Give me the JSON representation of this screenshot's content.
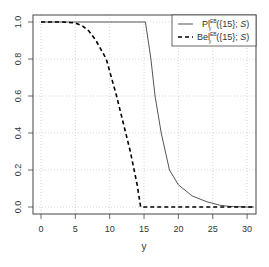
{
  "chart_data": {
    "type": "line",
    "title": "",
    "xlabel": "y",
    "ylabel": "",
    "xlim": [
      -1.2,
      31.2
    ],
    "ylim": [
      -0.04,
      1.04
    ],
    "grid": true,
    "legend_position": "top-right",
    "x_ticks": [
      "0",
      "5",
      "10",
      "15",
      "20",
      "25",
      "30"
    ],
    "y_ticks": [
      "0.0",
      "0.2",
      "0.4",
      "0.6",
      "0.8",
      "1.0"
    ],
    "series": [
      {
        "name": "Pl_y^EB({15}; S)",
        "style": "solid",
        "color": "#555555",
        "x": [
          0,
          5,
          10,
          15,
          15.2,
          16,
          16.6,
          17.5,
          18.7,
          20,
          22,
          24,
          26,
          27,
          28,
          30,
          31
        ],
        "y": [
          1,
          1,
          1,
          1,
          1.0,
          0.8,
          0.6,
          0.4,
          0.2,
          0.12,
          0.06,
          0.03,
          0.01,
          0.005,
          0.002,
          0,
          0
        ]
      },
      {
        "name": "Bel_y^EB({15}; S)",
        "style": "dashed",
        "color": "#000000",
        "x": [
          0,
          3,
          5,
          6,
          7,
          8,
          9.5,
          11,
          12,
          13,
          14,
          14.5,
          15,
          20,
          25,
          30,
          31
        ],
        "y": [
          1,
          1,
          0.995,
          0.98,
          0.95,
          0.9,
          0.8,
          0.6,
          0.45,
          0.3,
          0.12,
          0.0,
          0,
          0,
          0,
          0,
          0
        ]
      }
    ]
  },
  "legend": {
    "items": [
      {
        "main": "Pl",
        "sup": "EB",
        "sub": "y",
        "rest": "({15}; ",
        "ital": "S",
        "close": ")"
      },
      {
        "main": "Bel",
        "sup": "EB",
        "sub": "y",
        "rest": "({15}; ",
        "ital": "S",
        "close": ")"
      }
    ]
  }
}
